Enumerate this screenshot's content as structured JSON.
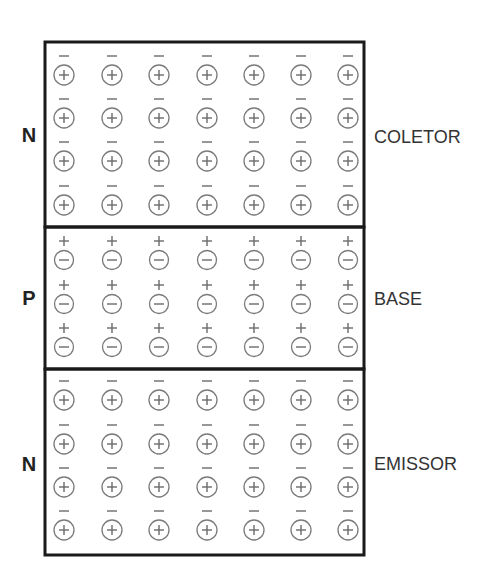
{
  "colors": {
    "border": "#1a1a1a",
    "ion_circle": "#7a7a7a",
    "sign": "#6a6a6a",
    "label": "#222222"
  },
  "regions": [
    {
      "id": "collector",
      "type_label": "N",
      "name_label": "COLETOR",
      "rows": 4,
      "columns": 7,
      "ion_sign": "+",
      "carrier_sign": "-"
    },
    {
      "id": "base",
      "type_label": "P",
      "name_label": "BASE",
      "rows": 3,
      "columns": 7,
      "ion_sign": "-",
      "carrier_sign": "+"
    },
    {
      "id": "emitter",
      "type_label": "N",
      "name_label": "EMISSOR",
      "rows": 4,
      "columns": 7,
      "ion_sign": "+",
      "carrier_sign": "-"
    }
  ]
}
